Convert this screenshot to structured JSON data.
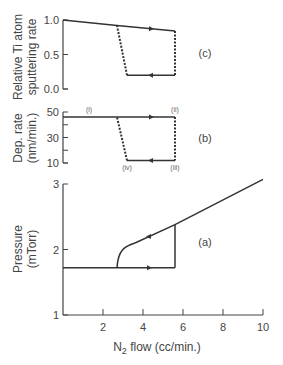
{
  "chart_data": [
    {
      "id": "c",
      "type": "line",
      "panel_label": "(c)",
      "ylabel": "Relative Ti atom sputtering rate",
      "ylabel_lines": [
        "Relative Ti atom",
        "sputtering rate"
      ],
      "ylim": [
        0.0,
        1.0
      ],
      "yticks": [
        "1.0",
        "0.5",
        "0.0"
      ],
      "ytick_values": [
        1.0,
        0.5,
        0.0
      ],
      "series": [
        {
          "name": "increasing flow (metallic mode)",
          "style": "solid",
          "x": [
            0,
            2.7,
            5.6
          ],
          "y": [
            1.0,
            0.92,
            0.84
          ],
          "arrow": {
            "x": 4.4,
            "dir": "right"
          }
        },
        {
          "name": "jump at critical flow",
          "style": "dashed",
          "x": [
            5.6,
            5.6
          ],
          "y": [
            0.84,
            0.2
          ]
        },
        {
          "name": "decreasing flow (poisoned mode)",
          "style": "solid",
          "x": [
            5.6,
            3.2
          ],
          "y": [
            0.2,
            0.2
          ],
          "arrow": {
            "x": 4.4,
            "dir": "left"
          }
        },
        {
          "name": "return transition",
          "style": "dashed",
          "x": [
            3.2,
            2.7
          ],
          "y": [
            0.2,
            0.92
          ]
        }
      ]
    },
    {
      "id": "b",
      "type": "line",
      "panel_label": "(b)",
      "ylabel": "Dep. rate (nm/min.)",
      "ylabel_lines": [
        "Dep. rate",
        "(nm/min.)"
      ],
      "ylim": [
        10,
        50
      ],
      "yticks": [
        "50",
        "30",
        "10"
      ],
      "ytick_values": [
        50,
        40,
        30,
        20,
        10
      ],
      "point_labels": [
        {
          "text": "(i)",
          "x": 1.3,
          "y": 46
        },
        {
          "text": "(ii)",
          "x": 5.6,
          "y": 46
        },
        {
          "text": "(iii)",
          "x": 5.6,
          "y": 12
        },
        {
          "text": "(iv)",
          "x": 3.2,
          "y": 12
        }
      ],
      "series": [
        {
          "name": "increasing flow (metallic mode)",
          "style": "solid",
          "x": [
            0,
            5.6
          ],
          "y": [
            46,
            46
          ],
          "arrow": {
            "x": 4.4,
            "dir": "right"
          }
        },
        {
          "name": "jump at critical flow",
          "style": "dashed",
          "x": [
            5.6,
            5.6
          ],
          "y": [
            46,
            12
          ]
        },
        {
          "name": "decreasing flow (poisoned mode)",
          "style": "solid",
          "x": [
            5.6,
            3.2
          ],
          "y": [
            12,
            12
          ],
          "arrow": {
            "x": 4.4,
            "dir": "left"
          }
        },
        {
          "name": "return transition",
          "style": "dashed",
          "x": [
            3.2,
            2.7
          ],
          "y": [
            12,
            46
          ]
        }
      ]
    },
    {
      "id": "a",
      "type": "line",
      "panel_label": "(a)",
      "ylabel": "Pressure (mTorr)",
      "ylabel_lines": [
        "Pressure",
        "(mTorr)"
      ],
      "xlabel": "N2 flow (cc/min.)",
      "xlabel_main": "N",
      "xlabel_sub": "2",
      "xlabel_rest": " flow (cc/min.)",
      "xlim": [
        0,
        10
      ],
      "ylim": [
        1,
        3
      ],
      "xticks": [
        "2",
        "4",
        "6",
        "8",
        "10"
      ],
      "xtick_values": [
        2,
        4,
        6,
        8,
        10
      ],
      "yticks": [
        "3",
        "2",
        "1"
      ],
      "ytick_values": [
        3,
        2,
        1
      ],
      "series": [
        {
          "name": "increasing flow",
          "style": "solid",
          "x": [
            0,
            5.6
          ],
          "y": [
            1.72,
            1.72
          ],
          "arrow": {
            "x": 4.3,
            "dir": "right"
          }
        },
        {
          "name": "jump at critical flow",
          "style": "solid",
          "x": [
            5.6,
            5.6
          ],
          "y": [
            1.72,
            2.38
          ]
        },
        {
          "name": "poisoned mode (linear)",
          "style": "solid",
          "x": [
            3.6,
            5.6,
            10
          ],
          "y": [
            2.1,
            2.38,
            3.07
          ],
          "arrow": {
            "x": 4.3,
            "dir": "left"
          }
        },
        {
          "name": "return curve",
          "style": "solid",
          "x": [
            2.7,
            2.8,
            3.1,
            3.6
          ],
          "y": [
            1.72,
            1.9,
            2.03,
            2.1
          ]
        }
      ]
    }
  ]
}
